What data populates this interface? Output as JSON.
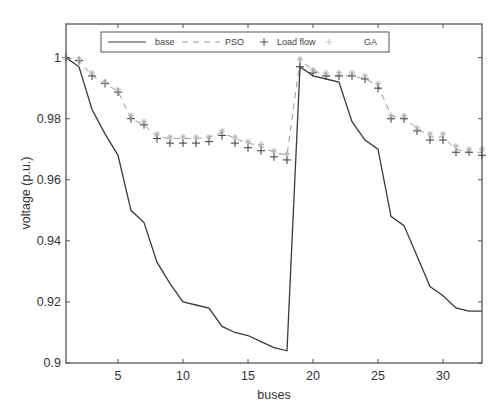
{
  "chart_data": {
    "type": "line",
    "title": "",
    "xlabel": "buses",
    "ylabel": "voltage (p.u.)",
    "xlim": [
      1,
      33
    ],
    "ylim": [
      0.9,
      1.011
    ],
    "xticks": [
      5,
      10,
      15,
      20,
      25,
      30
    ],
    "yticks": [
      0.9,
      0.92,
      0.94,
      0.96,
      0.98,
      1
    ],
    "ytick_labels": [
      "0.9",
      "0.92",
      "0.94",
      "0.96",
      "0.98",
      "1"
    ],
    "grid": false,
    "legend_position": "top, horizontal inside axes",
    "x": [
      1,
      2,
      3,
      4,
      5,
      6,
      7,
      8,
      9,
      10,
      11,
      12,
      13,
      14,
      15,
      16,
      17,
      18,
      19,
      20,
      21,
      22,
      23,
      24,
      25,
      26,
      27,
      28,
      29,
      30,
      31,
      32,
      33
    ],
    "series": [
      {
        "name": "base",
        "style": "solid",
        "color": "#3a3a3a",
        "values": [
          1.0,
          0.997,
          0.983,
          0.975,
          0.968,
          0.95,
          0.946,
          0.933,
          0.926,
          0.92,
          0.919,
          0.918,
          0.912,
          0.91,
          0.909,
          0.907,
          0.905,
          0.904,
          0.997,
          0.994,
          0.993,
          0.992,
          0.979,
          0.973,
          0.97,
          0.948,
          0.945,
          0.935,
          0.925,
          0.922,
          0.918,
          0.917,
          0.917
        ]
      },
      {
        "name": "PSO",
        "style": "dashed",
        "color": "#9a9a9a",
        "values": [
          1.0,
          0.999,
          0.994,
          0.9915,
          0.989,
          0.98,
          0.978,
          0.974,
          0.9735,
          0.9735,
          0.9735,
          0.974,
          0.9755,
          0.9735,
          0.972,
          0.971,
          0.969,
          0.968,
          0.999,
          0.996,
          0.994,
          0.994,
          0.994,
          0.993,
          0.991,
          0.981,
          0.98,
          0.977,
          0.974,
          0.974,
          0.97,
          0.969,
          0.969
        ]
      },
      {
        "name": "Load flow",
        "style": "plus-markers",
        "color": "#4a4a4a",
        "values": [
          1.0,
          0.999,
          0.994,
          0.9915,
          0.9887,
          0.98,
          0.978,
          0.9735,
          0.972,
          0.972,
          0.972,
          0.9725,
          0.9745,
          0.972,
          0.9705,
          0.9695,
          0.9675,
          0.9665,
          0.997,
          0.995,
          0.994,
          0.994,
          0.994,
          0.993,
          0.99,
          0.98,
          0.98,
          0.976,
          0.973,
          0.973,
          0.969,
          0.969,
          0.968
        ]
      },
      {
        "name": "GA",
        "style": "star-markers",
        "color": "#b0b0b0",
        "values": [
          1.0,
          0.9995,
          0.995,
          0.992,
          0.9895,
          0.981,
          0.979,
          0.975,
          0.974,
          0.974,
          0.974,
          0.974,
          0.976,
          0.974,
          0.9725,
          0.9715,
          0.9695,
          0.9685,
          0.9995,
          0.996,
          0.995,
          0.995,
          0.995,
          0.994,
          0.9915,
          0.981,
          0.981,
          0.977,
          0.975,
          0.975,
          0.971,
          0.97,
          0.97
        ]
      }
    ]
  },
  "legend": {
    "items": [
      {
        "label": "base"
      },
      {
        "label": "PSO"
      },
      {
        "label": "Load flow"
      },
      {
        "label": "GA"
      }
    ]
  }
}
